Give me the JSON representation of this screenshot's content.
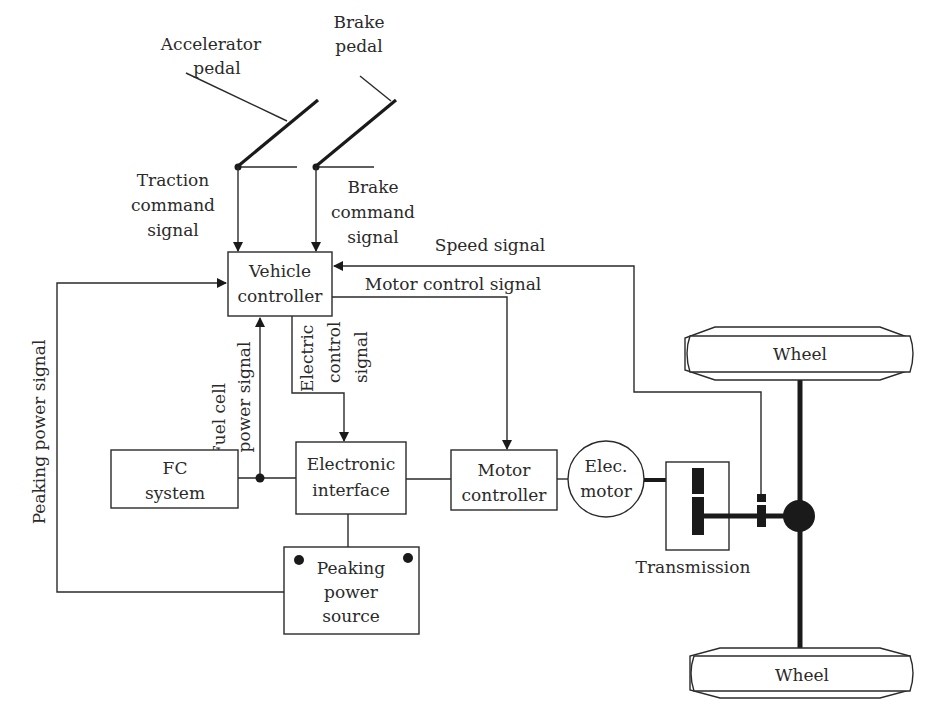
{
  "diagram": {
    "pedals": {
      "accelerator": {
        "line1": "Accelerator",
        "line2": "pedal"
      },
      "brake": {
        "line1": "Brake",
        "line2": "pedal"
      }
    },
    "signals": {
      "traction": {
        "line1": "Traction",
        "line2": "command",
        "line3": "signal"
      },
      "brake_cmd": {
        "line1": "Brake",
        "line2": "command",
        "line3": "signal"
      },
      "speed": "Speed signal",
      "motor_control": "Motor control signal",
      "electric_control": {
        "line1": "Electric",
        "line2": "control",
        "line3": "signal"
      },
      "fuel_cell_power": {
        "line1": "Fuel cell",
        "line2": "power signal"
      },
      "peaking_power": "Peaking power signal"
    },
    "blocks": {
      "vehicle_controller": {
        "line1": "Vehicle",
        "line2": "controller"
      },
      "fc_system": {
        "line1": "FC",
        "line2": "system"
      },
      "electronic_interface": {
        "line1": "Electronic",
        "line2": "interface"
      },
      "motor_controller": {
        "line1": "Motor",
        "line2": "controller"
      },
      "elec_motor": {
        "line1": "Elec.",
        "line2": "motor"
      },
      "peaking_power_source": {
        "line1": "Peaking",
        "line2": "power",
        "line3": "source"
      },
      "transmission": "Transmission",
      "wheel_top": "Wheel",
      "wheel_bottom": "Wheel"
    },
    "colors": {
      "stroke": "#2a2a2a",
      "background": "#ffffff"
    }
  }
}
